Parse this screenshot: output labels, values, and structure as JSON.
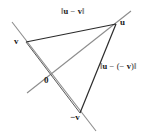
{
  "figure": {
    "type": "vector-diagram",
    "background_color": "#ffffff",
    "line_color_dark": "#2b2b2b",
    "line_color_gray": "#8c8c8c",
    "text_color": "#1a1a1a"
  },
  "points": {
    "u": {
      "label": "u",
      "x": 115,
      "y": 24
    },
    "v": {
      "label": "v",
      "x": 26,
      "y": 42
    },
    "origin": {
      "label": "0",
      "x": 49,
      "y": 76
    },
    "neg_v": {
      "label": "−v",
      "x": 80,
      "y": 112
    }
  },
  "labels": {
    "norm_u_minus_v": {
      "prefix": "‖",
      "a": "u",
      "op": " − ",
      "b": "v",
      "suffix": "‖"
    },
    "norm_u_minus_neg_v": {
      "prefix": "‖",
      "a": "u",
      "op": " − (− ",
      "b": "v",
      "suffix": ")‖"
    }
  },
  "segments": [
    {
      "name": "segment-v-to-u",
      "style": "dark"
    },
    {
      "name": "segment-u-to-neg-v",
      "style": "dark"
    },
    {
      "name": "line-v-through-origin-to-neg-v",
      "style": "gray"
    },
    {
      "name": "line-origin-to-u-extended",
      "style": "gray"
    }
  ]
}
